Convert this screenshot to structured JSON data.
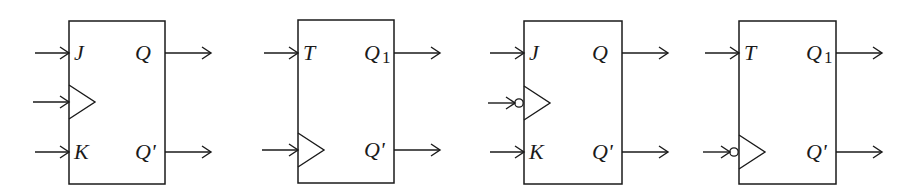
{
  "diagram": {
    "stroke_color": "#1a1a1a",
    "flipflops": [
      {
        "id": "jk-positive-edge",
        "type": "JK",
        "box": {
          "x": 69,
          "y": 21,
          "w": 96,
          "h": 163
        },
        "clock_edge": "positive",
        "inputs": [
          {
            "label": "J",
            "y": 53,
            "kind": "data"
          },
          {
            "label": "",
            "y": 102,
            "kind": "clock"
          },
          {
            "label": "K",
            "y": 152,
            "kind": "data"
          }
        ],
        "outputs": [
          {
            "label": "Q",
            "sub": "",
            "y": 53
          },
          {
            "label": "Q'",
            "sub": "",
            "y": 152
          }
        ]
      },
      {
        "id": "t-positive-edge",
        "type": "T",
        "box": {
          "x": 298,
          "y": 20,
          "w": 96,
          "h": 163
        },
        "clock_edge": "positive",
        "inputs": [
          {
            "label": "T",
            "y": 53,
            "kind": "data"
          },
          {
            "label": "",
            "y": 150,
            "kind": "clock"
          }
        ],
        "outputs": [
          {
            "label": "Q",
            "sub": "1",
            "y": 53
          },
          {
            "label": "Q'",
            "sub": "",
            "y": 150
          }
        ]
      },
      {
        "id": "jk-negative-edge",
        "type": "JK",
        "box": {
          "x": 524,
          "y": 21,
          "w": 98,
          "h": 163
        },
        "clock_edge": "negative",
        "inputs": [
          {
            "label": "J",
            "y": 53,
            "kind": "data"
          },
          {
            "label": "",
            "y": 103,
            "kind": "clock"
          },
          {
            "label": "K",
            "y": 152,
            "kind": "data"
          }
        ],
        "outputs": [
          {
            "label": "Q",
            "sub": "",
            "y": 53
          },
          {
            "label": "Q'",
            "sub": "",
            "y": 152
          }
        ]
      },
      {
        "id": "t-negative-edge",
        "type": "T",
        "box": {
          "x": 739,
          "y": 21,
          "w": 97,
          "h": 163
        },
        "clock_edge": "negative",
        "inputs": [
          {
            "label": "T",
            "y": 53,
            "kind": "data"
          },
          {
            "label": "",
            "y": 152,
            "kind": "clock"
          }
        ],
        "outputs": [
          {
            "label": "Q",
            "sub": "1",
            "y": 53
          },
          {
            "label": "Q'",
            "sub": "",
            "y": 152
          }
        ]
      }
    ]
  }
}
